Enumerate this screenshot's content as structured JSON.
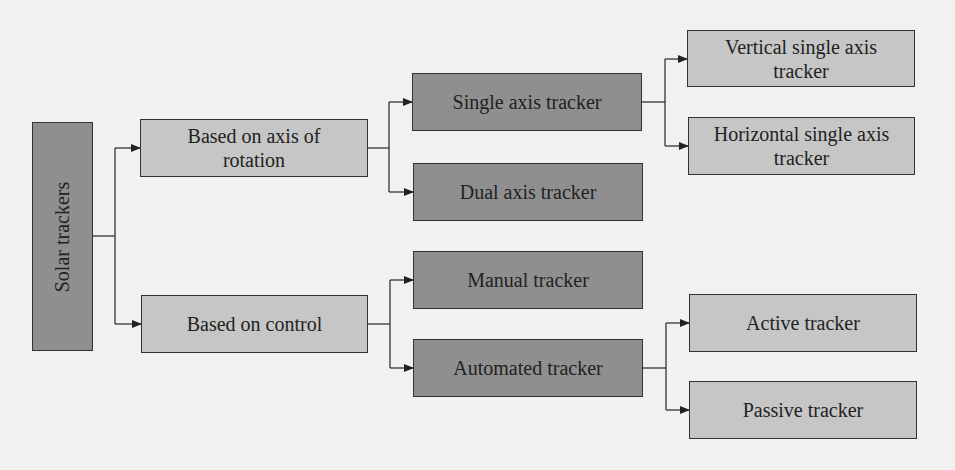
{
  "diagram": {
    "type": "tree",
    "colors": {
      "background": "#f1f1f1",
      "dark_box": "#8f8f8f",
      "light_box": "#c6c6c6",
      "line": "#333333"
    },
    "root": {
      "label": "Solar trackers"
    },
    "level1": [
      {
        "label": "Based on axis of rotation"
      },
      {
        "label": "Based on control"
      }
    ],
    "level2": [
      {
        "label": "Single axis tracker",
        "parent": "Based on axis of rotation"
      },
      {
        "label": "Dual axis tracker",
        "parent": "Based on axis of rotation"
      },
      {
        "label": "Manual tracker",
        "parent": "Based on control"
      },
      {
        "label": "Automated tracker",
        "parent": "Based on control"
      }
    ],
    "level3": [
      {
        "label": "Vertical single axis tracker",
        "parent": "Single axis tracker"
      },
      {
        "label": "Horizontal single axis tracker",
        "parent": "Single axis tracker"
      },
      {
        "label": "Active tracker",
        "parent": "Automated tracker"
      },
      {
        "label": "Passive tracker",
        "parent": "Automated tracker"
      }
    ]
  }
}
